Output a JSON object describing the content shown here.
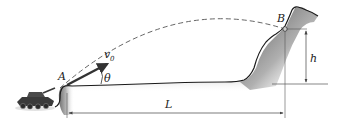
{
  "diagram": {
    "type": "projectile-motion",
    "labels": {
      "point_a": "A",
      "point_b": "B",
      "velocity": "v",
      "velocity_sub": "0",
      "angle": "θ",
      "height": "h",
      "distance": "L"
    },
    "colors": {
      "ground_line": "#1a1a1a",
      "ground_fill_dark": "#7a7a7a",
      "ground_fill_light": "#ffffff",
      "trajectory": "#555555",
      "dimension_lines": "#444444",
      "velocity_arrow": "#333333",
      "tank": "#3a3a3a"
    }
  }
}
